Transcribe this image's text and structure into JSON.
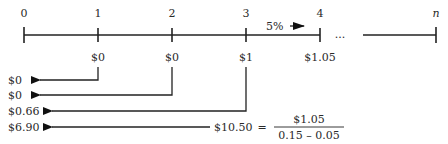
{
  "timeline": {
    "periods": [
      {
        "label": "0",
        "x": 24
      },
      {
        "label": "1",
        "x": 98
      },
      {
        "label": "2",
        "x": 172
      },
      {
        "label": "3",
        "x": 246
      },
      {
        "label": "4",
        "x": 320
      },
      {
        "label": "n",
        "x": 436
      }
    ],
    "ellipsis": "...",
    "growth_label": "5%",
    "cash_flows": [
      {
        "period": "1",
        "value": "$0"
      },
      {
        "period": "2",
        "value": "$0"
      },
      {
        "period": "3",
        "value": "$1"
      },
      {
        "period": "4",
        "value": "$1.05"
      }
    ]
  },
  "present_values": [
    {
      "value": "$0"
    },
    {
      "value": "$0"
    },
    {
      "value": "$0.66"
    },
    {
      "value": "$6.90"
    }
  ],
  "terminal_value": {
    "value": "$10.50",
    "equals": "=",
    "numerator": "$1.05",
    "denominator": "0.15 – 0.05"
  }
}
